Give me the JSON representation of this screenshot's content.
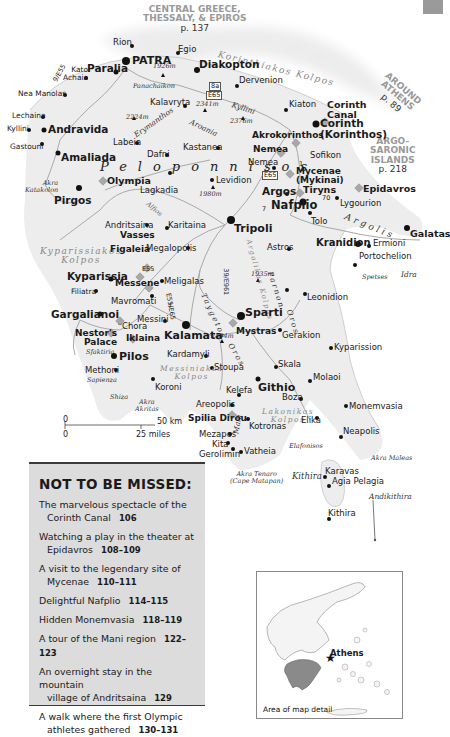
{
  "corner_tab": {
    "color": "#9a9a9a"
  },
  "regions": {
    "central_greece": {
      "line1": "CENTRAL GREECE,",
      "line2": "THESSALY, & EPIROS",
      "page": "p. 137"
    },
    "around_athens": {
      "line1": "AROUND",
      "line2": "ATHENS",
      "page": "p. 89"
    },
    "argo_saronic": {
      "line1": "ARGO-",
      "line2": "SARONIC",
      "line3": "ISLANDS",
      "page": "p. 218"
    }
  },
  "seas": {
    "korinthiakos": "Korinthiakos Kolpos",
    "kyparissiakos_1": "Kyparissiakos",
    "kyparissiakos_2": "Kolpos",
    "messiniakos_1": "Messiniakos",
    "messiniakos_2": "Kolpos",
    "lakonikos_1": "Lakonikos",
    "lakonikos_2": "Kolpos",
    "argolikos": "Argolikos Kolpos"
  },
  "region_name": "Peloponnisos",
  "prefectures": {
    "argolis": "Argolis",
    "taygetos": "Taygetos",
    "oros": "Oros",
    "parnon": "Parnon",
    "parnon_oros": "Oros",
    "mani": "Mani",
    "arvania": "Aroania",
    "kyllini": "Kyllini",
    "erymanthos": "Erymanthos",
    "alfios": "Alfios",
    "panachaikon": "Panachaikon"
  },
  "peaks": [
    "1926m",
    "2224m",
    "2341m",
    "2376m",
    "1980m",
    "1935m",
    "2404m"
  ],
  "roads": {
    "e65_a": "8a",
    "e65_b": "E65",
    "e65_c": "E65",
    "e55": "E55",
    "e55_65": "E55/E65",
    "r39": "39/E961",
    "r9": "9/E55",
    "r7a": "7",
    "r7b": "7",
    "r70": "70",
    "r1": "1"
  },
  "places": {
    "rion": "Rion",
    "patra": "PATRA",
    "egio": "Egio",
    "diakopton": "Diakopton",
    "dervenion": "Dervenion",
    "paralia": "Paralia",
    "kato_achaia_1": "Kato",
    "kato_achaia_2": "Achaia",
    "nea_manolas": "Nea Manolas",
    "lechaina": "Lechaina",
    "kyllini": "Kyllini",
    "andravida": "Andravida",
    "gastouni": "Gastouni",
    "amaliada": "Amaliada",
    "pirgos": "Pirgos",
    "akra_katakolon_1": "Akra",
    "akra_katakolon_2": "Katakolon",
    "olympia": "Olympia",
    "kalavryta": "Kalavryta",
    "labeia": "Labeia",
    "dafni": "Dafni",
    "kastanea": "Kastanea",
    "kiaton": "Kiaton",
    "corinth_canal_1": "Corinth",
    "corinth_canal_2": "Canal",
    "corinth_1": "Corinth",
    "corinth_2": "(Korinthos)",
    "akrokorinthos": "Akrokorinthos",
    "nemea_site": "Nemea",
    "nemea": "Nemea",
    "sofikon": "Sofikon",
    "mycenae_1": "Mycenae",
    "mycenae_2": "(Mykinai)",
    "argos": "Argos",
    "tiryns": "Tiryns",
    "nafplio": "Nafplio",
    "tolo": "Tolo",
    "lygourion": "Lygourion",
    "epidavros": "Epidavros",
    "levidion": "Levidion",
    "lagkadia": "Lagkadia",
    "tripoli": "Tripoli",
    "karitaina": "Karitaina",
    "andritsaina": "Andritsaina",
    "vasses": "Vasses",
    "figaleia": "Figaleia",
    "megalopolis": "Megalopolis",
    "kranidion": "Kranidion",
    "ermioni": "Ermioni",
    "portochelion": "Portochelion",
    "galatas": "Galatas",
    "spetses": "Spetses",
    "idra": "Idra",
    "astros": "Astros",
    "leonidion": "Leonidion",
    "kyparissia": "Kyparissia",
    "messene": "Messene",
    "meligalas": "Meligalas",
    "filiatra": "Filiatra",
    "mavromati": "Mavromati",
    "gargalianoi": "Gargalianoi",
    "messini": "Messini",
    "chora": "Chora",
    "kalamata": "Kalamata",
    "nestors_1": "Nestor's",
    "nestors_2": "Palace",
    "iklaina": "Iklaina",
    "sfaktiria": "Sfaktiria",
    "pilos": "Pilos",
    "methoni": "Methoni",
    "sapienza": "Sapienza",
    "shiza": "Shiza",
    "koroni": "Koroni",
    "akra_akritas_1": "Akra",
    "akra_akritas_2": "Akritas",
    "kardamyli": "Kardamyli",
    "stoupa": "Stoupa",
    "sparti": "Sparti",
    "mystras": "Mystras",
    "gerakion": "Gerakion",
    "kyparission": "Kyparission",
    "skala": "Skala",
    "molaoi": "Molaoi",
    "githio": "Githio",
    "kelefa": "Kelefa",
    "boza": "Boza",
    "areopolis": "Areopolis",
    "monemvasia": "Monemvasia",
    "spilia_dirou": "Spilia Dirou",
    "kotronas": "Kotronas",
    "elika": "Elika",
    "mezapos": "Mezapos",
    "neapolis": "Neapolis",
    "kita": "Kita",
    "vatheia": "Vatheia",
    "gerolimin": "Gerolimin",
    "elafonisos": "Elafonisos",
    "akra_maleas": "Akra Maleas",
    "akra_tenaro_1": "Akra Tenaro",
    "akra_tenaro_2": "(Cape Matapan)",
    "kithira_island": "Kithira",
    "karavas": "Karavas",
    "agia_pelagia": "Agia Pelagia",
    "andikithira": "Andikithira",
    "kithira": "Kithira"
  },
  "scale": {
    "zero_km": "0",
    "km": "50 km",
    "zero_mi": "0",
    "miles": "25 miles"
  },
  "not_to_be_missed": {
    "title": "NOT TO BE MISSED:",
    "items": [
      {
        "line1": "The marvelous spectacle of the",
        "line2": "Corinth Canal",
        "pages": "106"
      },
      {
        "line1": "Watching a play in the theater at",
        "line2": "Epidavros",
        "pages": "108–109"
      },
      {
        "line1": "A visit to the legendary site of",
        "line2": "Mycenae",
        "pages": "110–111"
      },
      {
        "line1": "Delightful Nafplio",
        "line2": "",
        "pages": "114–115"
      },
      {
        "line1": "Hidden Monemvasia",
        "line2": "",
        "pages": "118–119"
      },
      {
        "line1": "A tour of the Mani region",
        "line2": "",
        "pages": "122–123"
      },
      {
        "line1": "An overnight stay in the mountain",
        "line2": "village of Andritsaina",
        "pages": "129"
      },
      {
        "line1": "A walk where the first Olympic",
        "line2": "athletes gathered",
        "pages": "130–131"
      }
    ]
  },
  "inset": {
    "city": "Athens",
    "caption": "Area of map detail",
    "highlight_color": "#8a8a8a"
  },
  "colors": {
    "land": "#efefef",
    "sea": "#ffffff",
    "road": "#a9a9a9",
    "box": "#dcdcdc",
    "site": "#a8a8a8"
  }
}
